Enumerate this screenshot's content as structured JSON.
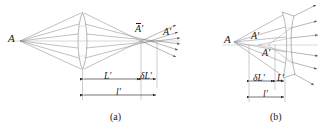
{
  "figure": {
    "type": "optical-ray-diagram",
    "panels": [
      {
        "id": "a",
        "caption": "(a)",
        "lens_type": "biconvex-converging",
        "object_label": "A",
        "image_labels": [
          "A'",
          "A'"
        ],
        "image_label_overbar": [
          true,
          false
        ],
        "dimensions": [
          {
            "name": "L'",
            "label": "L'"
          },
          {
            "name": "delta-L'",
            "label": "δL'"
          },
          {
            "name": "l'",
            "label": "l'"
          }
        ]
      },
      {
        "id": "b",
        "caption": "(b)",
        "lens_type": "biconcave-diverging",
        "object_label": "A",
        "image_labels": [
          "A'",
          "A'"
        ],
        "image_label_overbar": [
          false,
          false
        ],
        "dimensions": [
          {
            "name": "delta-L'",
            "label": "δL'"
          },
          {
            "name": "L'",
            "label": "L'"
          },
          {
            "name": "l'",
            "label": "l'"
          }
        ]
      }
    ],
    "colors": {
      "ray": "#8c8c8c",
      "lens_outline": "#9a9a9a",
      "axis": "#b4b4b4",
      "dimension": "#3a3a3a",
      "text": "#1a1a1a",
      "background": "#ffffff"
    }
  }
}
